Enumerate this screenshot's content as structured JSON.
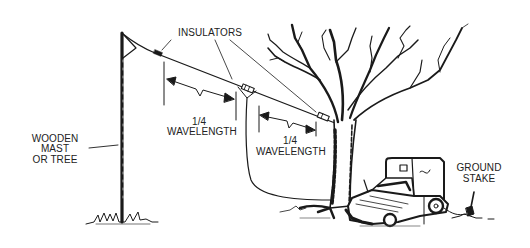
{
  "diagram": {
    "type": "illustration",
    "colors": {
      "ink": "#1a1a1a",
      "background": "#ffffff",
      "text": "#222222"
    },
    "labels": {
      "insulators": "INSULATORS",
      "wavelength_left_fraction": "1/4",
      "wavelength_left_text": "WAVELENGTH",
      "wavelength_right_fraction": "1/4",
      "wavelength_right_text": "WAVELENGTH",
      "mast_line1": "WOODEN",
      "mast_line2": "MAST",
      "mast_line3": "OR TREE",
      "ground_line1": "GROUND",
      "ground_line2": "STAKE"
    },
    "components": [
      {
        "id": "wooden-mast",
        "name": "Wooden mast or tree"
      },
      {
        "id": "antenna-wire",
        "name": "Antenna wire"
      },
      {
        "id": "insulator-left",
        "name": "End insulator (mast side)"
      },
      {
        "id": "insulator-center",
        "name": "Center insulator (feed point)"
      },
      {
        "id": "insulator-right",
        "name": "End insulator (tree side)"
      },
      {
        "id": "feed-line",
        "name": "Feed line to vehicle"
      },
      {
        "id": "tree",
        "name": "Tree"
      },
      {
        "id": "vehicle",
        "name": "Vehicle"
      },
      {
        "id": "ground-stake",
        "name": "Ground stake"
      }
    ]
  }
}
